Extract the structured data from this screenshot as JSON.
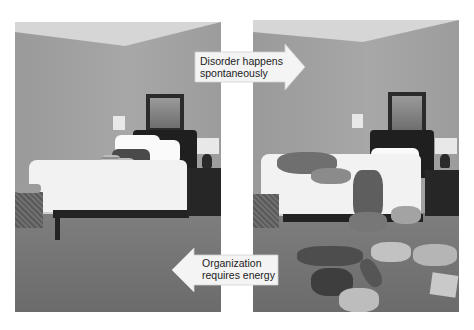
{
  "figure": {
    "left_photo": {
      "description": "Tidy bedroom with neatly made bed"
    },
    "right_photo": {
      "description": "Messy bedroom with clothes scattered on bed and floor"
    },
    "callouts": {
      "top": {
        "line1": "Disorder happens",
        "line2": "spontaneously",
        "direction": "right"
      },
      "bottom": {
        "line1": "Organization",
        "line2": "requires energy",
        "direction": "left"
      }
    }
  },
  "colors": {
    "callout_fill": "#f4f4f4",
    "callout_text": "#222222",
    "background": "#ffffff"
  }
}
